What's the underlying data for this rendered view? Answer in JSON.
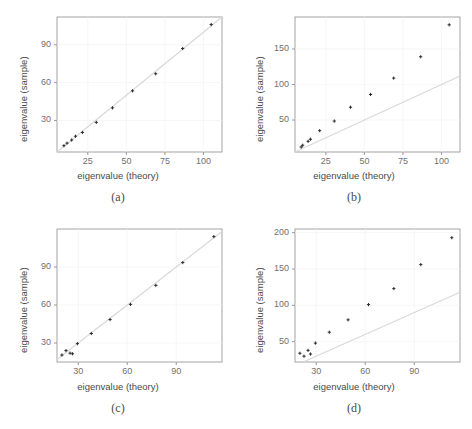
{
  "figure": {
    "axis_titles": {
      "x": "eigenvalue (theory)",
      "y": "eigenvalue (sample)"
    },
    "captions": [
      "(a)",
      "(b)",
      "(c)",
      "(d)"
    ],
    "colors": {
      "point": "#2b2b2b",
      "reference_line": "#d9d9d9",
      "frame": "#9a9a9a",
      "grid": "#f2f2f2",
      "background": "#ffffff",
      "text": "#4a4a4a"
    }
  },
  "chart_data": [
    {
      "type": "scatter",
      "panel": "(a)",
      "title": "",
      "xlabel": "eigenvalue (theory)",
      "ylabel": "eigenvalue (sample)",
      "xlim": [
        5,
        112
      ],
      "ylim": [
        5,
        112
      ],
      "xticks": [
        25,
        50,
        75,
        100
      ],
      "yticks": [
        30,
        60,
        90
      ],
      "grid": true,
      "reference_line": {
        "type": "identity",
        "from": [
          5,
          5
        ],
        "to": [
          112,
          112
        ]
      },
      "x": [
        9.5,
        11.5,
        14.5,
        17.0,
        21.5,
        30.5,
        41.0,
        54.0,
        69.0,
        86.5,
        105.0
      ],
      "y": [
        10.0,
        12.0,
        14.5,
        17.5,
        20.5,
        28.5,
        40.0,
        53.5,
        67.0,
        87.0,
        106.0
      ]
    },
    {
      "type": "scatter",
      "panel": "(b)",
      "title": "",
      "xlabel": "eigenvalue (theory)",
      "ylabel": "eigenvalue (sample)",
      "xlim": [
        5,
        112
      ],
      "ylim": [
        5,
        195
      ],
      "xticks": [
        25,
        50,
        75,
        100
      ],
      "yticks": [
        50,
        100,
        150
      ],
      "grid": true,
      "reference_line": {
        "type": "identity",
        "from": [
          5,
          5
        ],
        "to": [
          112,
          112
        ]
      },
      "x": [
        9.0,
        10.0,
        13.5,
        15.0,
        21.0,
        30.5,
        41.0,
        54.0,
        69.0,
        86.5,
        105.0
      ],
      "y": [
        12.0,
        14.5,
        20.0,
        23.0,
        35.0,
        48.5,
        68.0,
        86.0,
        109.0,
        139.0,
        184.0
      ]
    },
    {
      "type": "scatter",
      "panel": "(c)",
      "title": "",
      "xlabel": "eigenvalue (theory)",
      "ylabel": "eigenvalue (sample)",
      "xlim": [
        17,
        118
      ],
      "ylim": [
        15,
        120
      ],
      "xticks": [
        30,
        60,
        90
      ],
      "yticks": [
        30,
        60,
        90
      ],
      "grid": true,
      "reference_line": {
        "type": "identity",
        "from": [
          17,
          17
        ],
        "to": [
          118,
          118
        ]
      },
      "x": [
        20.0,
        22.5,
        25.0,
        26.5,
        29.5,
        38.0,
        49.5,
        62.0,
        77.5,
        94.0,
        113.0
      ],
      "y": [
        20.5,
        24.0,
        22.0,
        21.5,
        29.5,
        37.5,
        48.5,
        60.5,
        75.5,
        93.5,
        114.0
      ]
    },
    {
      "type": "scatter",
      "panel": "(d)",
      "title": "",
      "xlabel": "eigenvalue (theory)",
      "ylabel": "eigenvalue (sample)",
      "xlim": [
        17,
        118
      ],
      "ylim": [
        22,
        205
      ],
      "xticks": [
        30,
        60,
        90
      ],
      "yticks": [
        50,
        100,
        150,
        200
      ],
      "grid": true,
      "reference_line": {
        "type": "identity",
        "from": [
          22,
          22
        ],
        "to": [
          118,
          118
        ]
      },
      "x": [
        20.0,
        22.5,
        25.0,
        26.5,
        29.5,
        38.0,
        49.5,
        62.0,
        77.5,
        94.0,
        113.0
      ],
      "y": [
        34.0,
        30.0,
        38.0,
        33.0,
        48.0,
        63.0,
        80.0,
        101.0,
        123.0,
        156.0,
        193.0
      ]
    }
  ]
}
